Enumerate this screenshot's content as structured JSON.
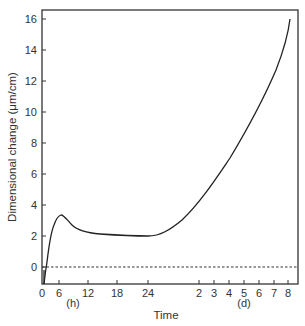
{
  "chart_data": {
    "type": "line",
    "title": "",
    "xlabel": "Time",
    "ylabel": "Dimensional change (μm/cm)",
    "ylim": [
      -1.1,
      16.5
    ],
    "yticks": [
      0,
      2,
      4,
      6,
      8,
      10,
      12,
      14,
      16
    ],
    "x_segments": [
      {
        "unit_label": "(h)",
        "ticks": [
          "0",
          "6",
          "12",
          "18",
          "24"
        ]
      },
      {
        "unit_label": "(d)",
        "ticks": [
          "2",
          "3",
          "4",
          "5",
          "6",
          "7",
          "8"
        ]
      }
    ],
    "reference_line": {
      "y": 0,
      "style": "dashed"
    },
    "grid": false,
    "legend": null,
    "series": [
      {
        "name": "Dimensional change",
        "points": [
          {
            "x": "0.5 h",
            "y": -1.1
          },
          {
            "x": "1 h",
            "y": 0.0
          },
          {
            "x": "2 h",
            "y": 1.6
          },
          {
            "x": "4 h",
            "y": 2.8
          },
          {
            "x": "6 h",
            "y": 3.2
          },
          {
            "x": "8 h",
            "y": 2.8
          },
          {
            "x": "10 h",
            "y": 2.4
          },
          {
            "x": "12 h",
            "y": 2.2
          },
          {
            "x": "18 h",
            "y": 2.1
          },
          {
            "x": "24 h",
            "y": 2.0
          },
          {
            "x": "1.5 d",
            "y": 2.8
          },
          {
            "x": "2 d",
            "y": 4.3
          },
          {
            "x": "3 d",
            "y": 6.2
          },
          {
            "x": "4 d",
            "y": 8.0
          },
          {
            "x": "5 d",
            "y": 9.9
          },
          {
            "x": "6 d",
            "y": 11.8
          },
          {
            "x": "7 d",
            "y": 13.9
          },
          {
            "x": "8 d",
            "y": 16.0
          }
        ]
      }
    ]
  },
  "labels": {
    "ylabel": "Dimensional change (μm/cm)",
    "xlabel": "Time",
    "hours_unit": "(h)",
    "days_unit": "(d)"
  }
}
